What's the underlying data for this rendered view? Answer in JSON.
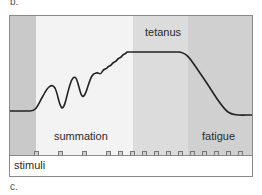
{
  "panel_labels": {
    "top": "b.",
    "bottom": "c."
  },
  "zones": [
    {
      "name": "rest",
      "label": ""
    },
    {
      "name": "summation",
      "label": "summation"
    },
    {
      "name": "tetanus",
      "label": "tetanus"
    },
    {
      "name": "fatigue",
      "label": "fatigue"
    }
  ],
  "stimuli": {
    "label": "stimuli",
    "marker_x": [
      24,
      48,
      72,
      96,
      108,
      120,
      132,
      144,
      156,
      168,
      180,
      192,
      204,
      216,
      228
    ]
  },
  "colors": {
    "rest": "#c9c9c9",
    "summation": "#f3f3f3",
    "tetanus": "#dcdcdc",
    "fatigue": "#d0d0d0",
    "curve": "#222222"
  }
}
